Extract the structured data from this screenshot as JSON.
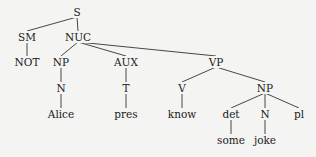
{
  "diagram": {
    "type": "syntax-tree",
    "nodes": {
      "S": {
        "label": "S",
        "x": 77,
        "y": 12
      },
      "SM": {
        "label": "SM",
        "x": 27,
        "y": 37
      },
      "NUC": {
        "label": "NUC",
        "x": 78,
        "y": 37
      },
      "NOT": {
        "label": "NOT",
        "x": 27,
        "y": 62
      },
      "NP1": {
        "label": "NP",
        "x": 61,
        "y": 62
      },
      "AUX": {
        "label": "AUX",
        "x": 126,
        "y": 62
      },
      "VP": {
        "label": "VP",
        "x": 216,
        "y": 62
      },
      "N1": {
        "label": "N",
        "x": 61,
        "y": 88
      },
      "T": {
        "label": "T",
        "x": 126,
        "y": 88
      },
      "V": {
        "label": "V",
        "x": 182,
        "y": 88
      },
      "NP2": {
        "label": "NP",
        "x": 265,
        "y": 88
      },
      "Alice": {
        "label": "Alice",
        "x": 61,
        "y": 114
      },
      "pres": {
        "label": "pres",
        "x": 126,
        "y": 114
      },
      "know": {
        "label": "know",
        "x": 182,
        "y": 114
      },
      "det": {
        "label": "det",
        "x": 231,
        "y": 114
      },
      "N2": {
        "label": "N",
        "x": 265,
        "y": 114
      },
      "pl": {
        "label": "pl",
        "x": 299,
        "y": 114
      },
      "some": {
        "label": "some",
        "x": 231,
        "y": 140
      },
      "joke": {
        "label": "joke",
        "x": 265,
        "y": 140
      }
    },
    "edges": [
      [
        "S",
        "SM"
      ],
      [
        "S",
        "NUC"
      ],
      [
        "SM",
        "NOT"
      ],
      [
        "NUC",
        "NP1"
      ],
      [
        "NUC",
        "AUX"
      ],
      [
        "NUC",
        "VP"
      ],
      [
        "NP1",
        "N1"
      ],
      [
        "N1",
        "Alice"
      ],
      [
        "AUX",
        "T"
      ],
      [
        "T",
        "pres"
      ],
      [
        "VP",
        "V"
      ],
      [
        "VP",
        "NP2"
      ],
      [
        "V",
        "know"
      ],
      [
        "NP2",
        "det"
      ],
      [
        "NP2",
        "N2"
      ],
      [
        "NP2",
        "pl"
      ],
      [
        "det",
        "some"
      ],
      [
        "N2",
        "joke"
      ]
    ]
  }
}
